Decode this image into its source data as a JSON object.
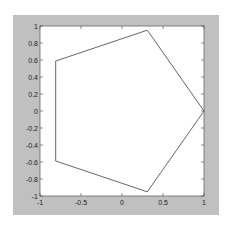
{
  "chart_data": {
    "type": "line",
    "title": "",
    "xlabel": "",
    "ylabel": "",
    "xlim": [
      -1,
      1
    ],
    "ylim": [
      -1,
      1
    ],
    "grid": false,
    "legend": null,
    "series": [
      {
        "name": "pentagon",
        "closed": true,
        "color": "#555555",
        "x": [
          1,
          0.309,
          -0.809,
          -0.809,
          0.309,
          1
        ],
        "y": [
          0,
          0.951,
          0.588,
          -0.588,
          -0.951,
          0
        ]
      }
    ],
    "xticks": [
      -1,
      -0.5,
      0,
      0.5,
      1
    ],
    "xtick_labels": [
      "-1",
      "-0.5",
      "0",
      "0.5",
      "1"
    ],
    "yticks": [
      1,
      0.8,
      0.6,
      0.4,
      0.2,
      0,
      -0.2,
      -0.4,
      -0.6,
      -0.8,
      -1
    ],
    "ytick_labels": [
      "1",
      "0.8",
      "0.6",
      "0.4",
      "0.2",
      "0",
      "-0.2",
      "-0.4",
      "-0.6",
      "-0.8",
      "-1"
    ]
  },
  "colors": {
    "figure_background": "#c0c0c0",
    "axes_background": "#ffffff",
    "line": "#555555"
  }
}
